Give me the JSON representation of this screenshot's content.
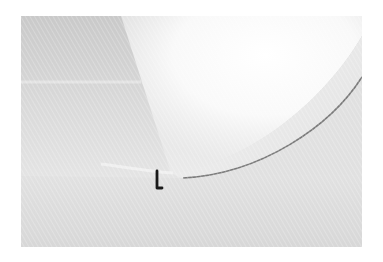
{
  "image": {
    "description": "Abstract monochrome photograph of a white textured surface with a bright curved light wedge and a small dark hook-shaped object",
    "colors": {
      "border": "#ffffff",
      "surface_shadow": "#c9c9c9",
      "surface_mid": "#dedede",
      "highlight": "#ffffff",
      "curve_edge": "#7a7a7a",
      "object": "#1a1a1a"
    }
  }
}
